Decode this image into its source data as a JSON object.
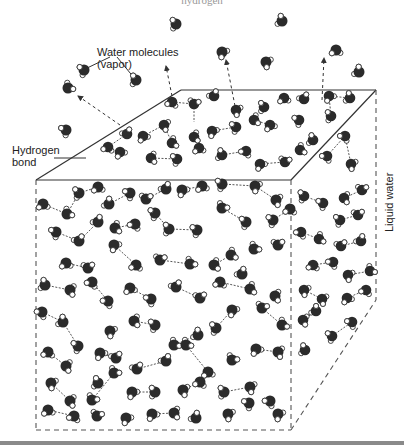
{
  "figure": {
    "top_cut_text": "hydrogen",
    "labels": {
      "vapor": [
        "Water molecules",
        "(vapor)"
      ],
      "hydrogen_bond": [
        "Hydrogen",
        "bond"
      ],
      "liquid": "Liquid water"
    },
    "colors": {
      "oxygen": "#2b2b2b",
      "hydrogen_fill": "#ffffff",
      "hydrogen_stroke": "#333333",
      "edge": "#333333",
      "dashed_edge": "#555555",
      "bottom_bar": "#8a8a8a"
    },
    "cube": {
      "top_back_left": [
        181,
        90
      ],
      "top_back_right": [
        376,
        90
      ],
      "top_front_left": [
        36,
        180
      ],
      "top_front_right": [
        291,
        180
      ],
      "bottom_front_left": [
        36,
        430
      ],
      "bottom_front_right": [
        291,
        430
      ],
      "bottom_back_right": [
        376,
        300
      ]
    },
    "vapor_arrows": [
      [
        120,
        125,
        78,
        96
      ],
      [
        172,
        96,
        166,
        66
      ],
      [
        235,
        106,
        226,
        60
      ],
      [
        322,
        100,
        324,
        58
      ]
    ],
    "vapor_molecules": [
      [
        176,
        24
      ],
      [
        282,
        21
      ],
      [
        222,
        52
      ],
      [
        336,
        50
      ],
      [
        84,
        70
      ],
      [
        136,
        80
      ],
      [
        266,
        62
      ],
      [
        68,
        88
      ],
      [
        359,
        72
      ],
      [
        66,
        130
      ]
    ],
    "surface_molecules": [
      [
        172,
        102
      ],
      [
        194,
        104
      ],
      [
        214,
        96
      ],
      [
        236,
        110
      ],
      [
        264,
        107
      ],
      [
        284,
        98
      ],
      [
        304,
        99
      ],
      [
        329,
        96
      ],
      [
        350,
        98
      ],
      [
        331,
        116
      ],
      [
        143,
        136
      ],
      [
        164,
        125
      ],
      [
        172,
        143
      ],
      [
        194,
        137
      ],
      [
        212,
        131
      ],
      [
        236,
        127
      ],
      [
        254,
        120
      ],
      [
        270,
        125
      ],
      [
        299,
        120
      ],
      [
        313,
        140
      ],
      [
        127,
        134
      ],
      [
        108,
        147
      ],
      [
        120,
        152
      ],
      [
        151,
        158
      ],
      [
        177,
        159
      ],
      [
        199,
        148
      ],
      [
        222,
        155
      ],
      [
        246,
        151
      ],
      [
        260,
        164
      ],
      [
        285,
        162
      ],
      [
        345,
        136
      ],
      [
        327,
        156
      ],
      [
        351,
        164
      ],
      [
        300,
        150
      ]
    ],
    "liquid_molecules": [
      [
        43,
        204
      ],
      [
        67,
        214
      ],
      [
        79,
        193
      ],
      [
        98,
        187
      ],
      [
        109,
        204
      ],
      [
        130,
        193
      ],
      [
        146,
        199
      ],
      [
        166,
        189
      ],
      [
        182,
        190
      ],
      [
        202,
        186
      ],
      [
        222,
        184
      ],
      [
        255,
        186
      ],
      [
        276,
        200
      ],
      [
        56,
        232
      ],
      [
        79,
        241
      ],
      [
        98,
        222
      ],
      [
        115,
        228
      ],
      [
        135,
        224
      ],
      [
        155,
        213
      ],
      [
        169,
        229
      ],
      [
        197,
        230
      ],
      [
        222,
        208
      ],
      [
        246,
        222
      ],
      [
        273,
        220
      ],
      [
        290,
        209
      ],
      [
        66,
        263
      ],
      [
        88,
        268
      ],
      [
        114,
        245
      ],
      [
        136,
        265
      ],
      [
        160,
        260
      ],
      [
        190,
        264
      ],
      [
        214,
        265
      ],
      [
        231,
        255
      ],
      [
        254,
        249
      ],
      [
        278,
        245
      ],
      [
        242,
        274
      ],
      [
        45,
        285
      ],
      [
        70,
        290
      ],
      [
        92,
        282
      ],
      [
        108,
        301
      ],
      [
        130,
        288
      ],
      [
        151,
        299
      ],
      [
        176,
        287
      ],
      [
        200,
        298
      ],
      [
        220,
        282
      ],
      [
        250,
        289
      ],
      [
        275,
        296
      ],
      [
        42,
        312
      ],
      [
        63,
        322
      ],
      [
        78,
        346
      ],
      [
        110,
        331
      ],
      [
        134,
        321
      ],
      [
        155,
        325
      ],
      [
        174,
        345
      ],
      [
        198,
        335
      ],
      [
        216,
        328
      ],
      [
        232,
        310
      ],
      [
        262,
        308
      ],
      [
        282,
        325
      ],
      [
        48,
        352
      ],
      [
        66,
        366
      ],
      [
        100,
        353
      ],
      [
        116,
        358
      ],
      [
        137,
        369
      ],
      [
        166,
        361
      ],
      [
        186,
        345
      ],
      [
        208,
        372
      ],
      [
        232,
        360
      ],
      [
        256,
        349
      ],
      [
        278,
        352
      ],
      [
        51,
        383
      ],
      [
        70,
        401
      ],
      [
        98,
        383
      ],
      [
        92,
        400
      ],
      [
        114,
        373
      ],
      [
        132,
        392
      ],
      [
        155,
        392
      ],
      [
        183,
        390
      ],
      [
        200,
        382
      ],
      [
        224,
        392
      ],
      [
        250,
        387
      ],
      [
        270,
        401
      ],
      [
        48,
        410
      ],
      [
        74,
        416
      ],
      [
        97,
        416
      ],
      [
        126,
        418
      ],
      [
        152,
        414
      ],
      [
        174,
        413
      ],
      [
        196,
        418
      ],
      [
        228,
        414
      ],
      [
        249,
        403
      ],
      [
        278,
        414
      ]
    ],
    "side_molecules": [
      [
        304,
        196
      ],
      [
        323,
        203
      ],
      [
        344,
        198
      ],
      [
        362,
        190
      ],
      [
        340,
        220
      ],
      [
        358,
        215
      ],
      [
        301,
        232
      ],
      [
        319,
        239
      ],
      [
        341,
        246
      ],
      [
        361,
        241
      ],
      [
        313,
        265
      ],
      [
        333,
        262
      ],
      [
        348,
        275
      ],
      [
        370,
        271
      ],
      [
        304,
        290
      ],
      [
        322,
        299
      ],
      [
        347,
        298
      ],
      [
        366,
        290
      ],
      [
        303,
        320
      ],
      [
        316,
        311
      ],
      [
        332,
        336
      ],
      [
        352,
        322
      ],
      [
        305,
        350
      ]
    ],
    "bonds": [
      [
        172,
        102,
        194,
        104
      ],
      [
        194,
        104,
        194,
        122
      ],
      [
        329,
        96,
        350,
        98
      ],
      [
        329,
        96,
        331,
        116
      ],
      [
        143,
        136,
        164,
        125
      ],
      [
        164,
        125,
        172,
        143
      ],
      [
        212,
        131,
        236,
        127
      ],
      [
        254,
        120,
        270,
        125
      ],
      [
        108,
        147,
        127,
        134
      ],
      [
        151,
        158,
        177,
        159
      ],
      [
        222,
        155,
        246,
        151
      ],
      [
        260,
        164,
        285,
        162
      ],
      [
        345,
        136,
        327,
        156
      ],
      [
        345,
        136,
        351,
        164
      ],
      [
        43,
        204,
        67,
        214
      ],
      [
        67,
        214,
        79,
        193
      ],
      [
        79,
        193,
        98,
        187
      ],
      [
        109,
        204,
        130,
        193
      ],
      [
        146,
        199,
        166,
        189
      ],
      [
        182,
        190,
        202,
        186
      ],
      [
        222,
        184,
        255,
        186
      ],
      [
        255,
        186,
        276,
        200
      ],
      [
        56,
        232,
        79,
        241
      ],
      [
        79,
        241,
        98,
        222
      ],
      [
        115,
        228,
        135,
        224
      ],
      [
        155,
        213,
        169,
        229
      ],
      [
        169,
        229,
        197,
        230
      ],
      [
        222,
        208,
        246,
        222
      ],
      [
        273,
        220,
        290,
        209
      ],
      [
        66,
        263,
        88,
        268
      ],
      [
        114,
        245,
        136,
        265
      ],
      [
        160,
        260,
        190,
        264
      ],
      [
        214,
        265,
        231,
        255
      ],
      [
        45,
        285,
        70,
        290
      ],
      [
        92,
        282,
        108,
        301
      ],
      [
        130,
        288,
        151,
        299
      ],
      [
        176,
        287,
        200,
        298
      ],
      [
        220,
        282,
        250,
        289
      ],
      [
        42,
        312,
        63,
        322
      ],
      [
        63,
        322,
        78,
        346
      ],
      [
        134,
        321,
        155,
        325
      ],
      [
        174,
        345,
        198,
        335
      ],
      [
        216,
        328,
        232,
        310
      ],
      [
        262,
        308,
        282,
        325
      ],
      [
        48,
        352,
        66,
        366
      ],
      [
        100,
        353,
        116,
        358
      ],
      [
        137,
        369,
        166,
        361
      ],
      [
        186,
        345,
        208,
        372
      ],
      [
        256,
        349,
        278,
        352
      ],
      [
        51,
        383,
        70,
        401
      ],
      [
        92,
        400,
        114,
        373
      ],
      [
        132,
        392,
        155,
        392
      ],
      [
        183,
        390,
        200,
        382
      ],
      [
        224,
        392,
        250,
        387
      ],
      [
        48,
        410,
        74,
        416
      ],
      [
        152,
        414,
        174,
        413
      ],
      [
        304,
        196,
        323,
        203
      ],
      [
        344,
        198,
        362,
        190
      ],
      [
        340,
        220,
        358,
        215
      ],
      [
        301,
        232,
        319,
        239
      ],
      [
        341,
        246,
        361,
        241
      ],
      [
        313,
        265,
        333,
        262
      ],
      [
        348,
        275,
        370,
        271
      ],
      [
        304,
        290,
        322,
        299
      ],
      [
        347,
        298,
        366,
        290
      ],
      [
        303,
        320,
        316,
        311
      ],
      [
        332,
        336,
        352,
        322
      ]
    ],
    "hydrogen_bond_leader": [
      54,
      158,
      86,
      158
    ],
    "vapor_leaders": [
      [
        110,
        57,
        83,
        70
      ],
      [
        117,
        57,
        135,
        79
      ]
    ]
  }
}
